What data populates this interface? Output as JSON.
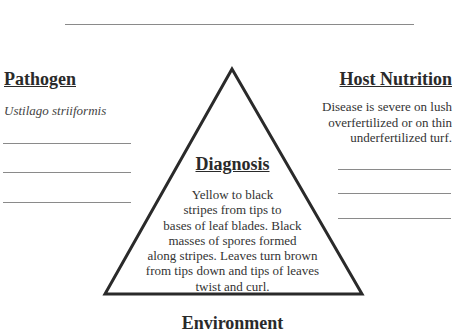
{
  "title_line": "",
  "pathogen": {
    "heading": "Pathogen",
    "value": "Ustilago striiformis",
    "blank_lines": 3
  },
  "host_nutrition": {
    "heading": "Host Nutrition",
    "lines": [
      "Disease is severe on lush",
      "overfertilized or on thin",
      "underfertilized turf."
    ],
    "blank_lines": 3
  },
  "diagnosis": {
    "heading": "Diagnosis",
    "lines": [
      "Yellow to black",
      "stripes from tips to",
      "bases of leaf blades.  Black",
      "masses of spores formed",
      "along stripes.  Leaves turn brown",
      "from tips down and tips of leaves",
      "twist and curl."
    ]
  },
  "environment": {
    "heading": "Environment"
  }
}
